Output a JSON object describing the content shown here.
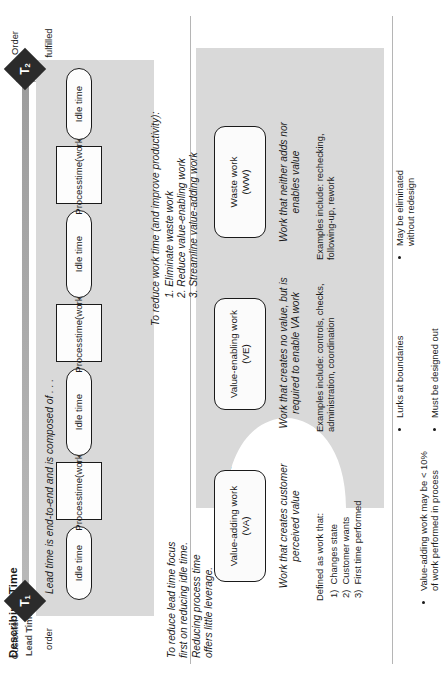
{
  "figure": {
    "sections": [
      {
        "id": "time",
        "title": "Describing Time"
      },
      {
        "id": "work",
        "title": "Describing Work"
      }
    ]
  },
  "time_section": {
    "title": "Describing Time",
    "axis_label": "Lead Time",
    "start_marker": {
      "label": "T",
      "sub": "1",
      "caption_line1": "Customer",
      "caption_line2": "order"
    },
    "end_marker": {
      "label": "T",
      "sub": "2",
      "caption_line1": "Order",
      "caption_line2": "fulfilled"
    },
    "caption": "Lead time is end-to-end and is composed of . . .",
    "blocks": [
      {
        "type": "idle",
        "label": "Idle time"
      },
      {
        "type": "process",
        "line1": "Process",
        "line2": "time",
        "line3": "(work)"
      },
      {
        "type": "idle",
        "label": "Idle time"
      },
      {
        "type": "process",
        "line1": "Process",
        "line2": "time",
        "line3": "(work)"
      },
      {
        "type": "idle",
        "label": "Idle time"
      },
      {
        "type": "process",
        "line1": "Process",
        "line2": "time",
        "line3": "(work)"
      },
      {
        "type": "idle",
        "label": "Idle time"
      }
    ],
    "note": "To reduce lead time focus\nfirst on reducing idle time.\nReducing process time\noffers little leverage.",
    "improve_heading": "To reduce work time (and improve productivity):",
    "improve_steps": [
      "1. Eliminate waste work",
      "2. Reduce value-enabling work",
      "3. Streamline value-adding work"
    ]
  },
  "work_section": {
    "title": "Describing Work",
    "caption": "Work consumes resources and includes . . .",
    "categories": [
      {
        "name_line1": "Value-adding work",
        "name_line2": "(VA)",
        "definition": "Work that creates customer\nperceived value",
        "detail_heading": "Defined as work that:",
        "detail_items": [
          "1)  Changes state",
          "2)  Customer wants",
          "3)  First time performed"
        ],
        "bullets": [
          "Value-adding work may be < 10%\nof work performed in process"
        ]
      },
      {
        "name_line1": "Value-enabling work",
        "name_line2": "(VE)",
        "definition": "Work that creates no value, but is\nrequired to enable VA work",
        "detail_heading": "Examples include: controls, checks,\nadministration, coordination",
        "detail_items": [],
        "bullets": [
          "Lurks at boundaries",
          "Must be designed out"
        ]
      },
      {
        "name_line1": "Waste work",
        "name_line2": "(WW)",
        "definition": "Work that neither adds nor\nenables value",
        "detail_heading": "Examples include: rechecking,\nfollowing-up, rework",
        "detail_items": [],
        "bullets": [
          "May be eliminated\nwithout redesign"
        ]
      }
    ]
  },
  "colors": {
    "band": "#d9d9d9",
    "marker": "#2b2b2b",
    "axis": "#a6a6a6",
    "box_border": "#1a1a1a",
    "text": "#1a1a1a"
  }
}
